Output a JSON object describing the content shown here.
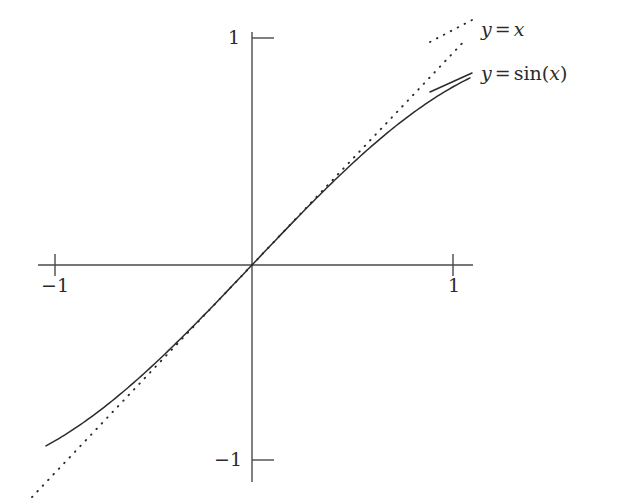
{
  "figure": {
    "background_color": "#ffffff",
    "axis_color": "#4a4a4a",
    "curve_color": "#2b2b2b"
  },
  "axes": {
    "origin_px": {
      "x": 252,
      "y": 265
    },
    "x_axis": {
      "start_px": 38,
      "end_px": 473,
      "y_px": 265
    },
    "y_axis": {
      "start_px": 32,
      "end_px": 482,
      "x_px": 252
    },
    "px_per_unit_x": 200,
    "px_per_unit_y": 211
  },
  "ticks": {
    "x": [
      {
        "value": -1,
        "label": "−1",
        "px": 55
      },
      {
        "value": 1,
        "label": "1",
        "px": 453
      }
    ],
    "y": [
      {
        "value": 1,
        "label": "1",
        "px": 38
      },
      {
        "value": -1,
        "label": "−1",
        "px": 460
      }
    ]
  },
  "legend": {
    "position": "top-right",
    "entries": [
      {
        "name": "y-eq-x",
        "label": "y = x",
        "lhs": "y",
        "operator": "=",
        "rhs": "x",
        "style": "dotted"
      },
      {
        "name": "y-eq-sin-x",
        "label": "y = sin(x)",
        "lhs": "y",
        "operator": "=",
        "fn": "sin",
        "arg": "x",
        "style": "solid"
      }
    ]
  },
  "chart_data": {
    "type": "line",
    "title": "",
    "xlabel": "",
    "ylabel": "",
    "xlim": [
      -1.12,
      1.12
    ],
    "ylim": [
      -1.12,
      1.12
    ],
    "grid": false,
    "legend_position": "top-right",
    "xticks": [
      -1,
      1
    ],
    "yticks": [
      -1,
      1
    ],
    "xticklabels": [
      "−1",
      "1"
    ],
    "yticklabels": [
      "−1",
      "1"
    ],
    "series": [
      {
        "name": "y = x",
        "style": "dotted",
        "color": "#2b2b2b",
        "x": [
          -1.1,
          -1.0,
          -0.9,
          -0.8,
          -0.7,
          -0.6,
          -0.5,
          -0.4,
          -0.3,
          -0.2,
          -0.1,
          0.0,
          0.1,
          0.2,
          0.3,
          0.4,
          0.5,
          0.6,
          0.7,
          0.8,
          0.9,
          1.0,
          1.06
        ],
        "values": [
          -1.1,
          -1.0,
          -0.9,
          -0.8,
          -0.7,
          -0.6,
          -0.5,
          -0.4,
          -0.3,
          -0.2,
          -0.1,
          0.0,
          0.1,
          0.2,
          0.3,
          0.4,
          0.5,
          0.6,
          0.7,
          0.8,
          0.9,
          1.0,
          1.06
        ]
      },
      {
        "name": "y = sin(x)",
        "style": "solid",
        "color": "#2b2b2b",
        "x": [
          -1.03,
          -0.95,
          -0.85,
          -0.75,
          -0.65,
          -0.55,
          -0.45,
          -0.35,
          -0.25,
          -0.15,
          -0.05,
          0.0,
          0.05,
          0.15,
          0.25,
          0.35,
          0.45,
          0.55,
          0.65,
          0.75,
          0.85,
          0.95,
          1.05,
          1.09
        ],
        "values": [
          -0.8573,
          -0.8134,
          -0.7513,
          -0.6816,
          -0.6052,
          -0.5227,
          -0.435,
          -0.3429,
          -0.2474,
          -0.1494,
          -0.05,
          0.0,
          0.05,
          0.1494,
          0.2474,
          0.3429,
          0.435,
          0.5227,
          0.6052,
          0.6816,
          0.7513,
          0.8134,
          0.8674,
          0.8866
        ]
      }
    ]
  }
}
